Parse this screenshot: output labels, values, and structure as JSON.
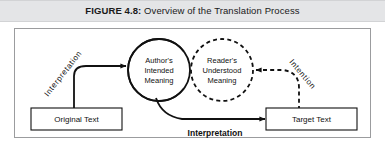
{
  "figure": {
    "number_label": "FIGURE 4.8:",
    "title": "Overview of the Translation Process",
    "caption_full": "FIGURE 4.8: Overview of the Translation Process"
  },
  "diagram": {
    "type": "process-flow",
    "nodes": [
      {
        "id": "original-text",
        "shape": "rectangle",
        "label": "Original Text",
        "border": "solid"
      },
      {
        "id": "authors-intended-meaning",
        "shape": "circle",
        "label_lines": [
          "Author's",
          "Intended",
          "Meaning"
        ],
        "label": "Author's Intended Meaning",
        "border": "solid"
      },
      {
        "id": "readers-understood-meaning",
        "shape": "circle",
        "label_lines": [
          "Reader's",
          "Understood",
          "Meaning"
        ],
        "label": "Reader's Understood Meaning",
        "border": "dashed"
      },
      {
        "id": "target-text",
        "shape": "rectangle",
        "label": "Target Text",
        "border": "solid"
      }
    ],
    "edges": [
      {
        "id": "edge-interpretation-in",
        "from": "original-text",
        "to": "authors-intended-meaning",
        "label": "Interpretation",
        "style": "solid",
        "label_orientation": "arc-rotated"
      },
      {
        "id": "edge-interpretation-out",
        "from": "authors-intended-meaning",
        "to": "target-text",
        "label": "Interpretation",
        "style": "solid",
        "label_orientation": "horizontal-bold"
      },
      {
        "id": "edge-intention",
        "from": "target-text",
        "to": "readers-understood-meaning",
        "label": "Intention",
        "style": "dashed",
        "label_orientation": "arc-rotated"
      }
    ],
    "colors": {
      "caption_band": "#e4e5e7",
      "frame_border": "#9b9c9e",
      "stroke": "#111111",
      "background": "#ffffff",
      "text": "#1a1a1a"
    }
  }
}
